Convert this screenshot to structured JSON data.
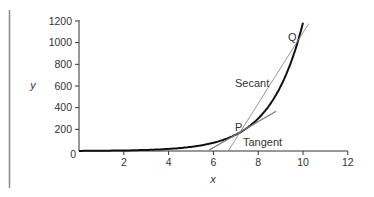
{
  "chart_data": {
    "type": "line",
    "title": "",
    "xlabel": "x",
    "ylabel": "y",
    "xlim": [
      0,
      12
    ],
    "ylim": [
      0,
      1200
    ],
    "xticks": [
      0,
      2,
      4,
      6,
      8,
      10,
      12
    ],
    "xtick_labels": [
      "0",
      "2",
      "4",
      "6",
      "8",
      "10",
      "12"
    ],
    "yticks": [
      0,
      200,
      400,
      600,
      800,
      1000,
      1200
    ],
    "ytick_labels": [
      "0",
      "200",
      "400",
      "600",
      "800",
      "1000",
      "1200"
    ],
    "grid": false,
    "legend": null,
    "series": [
      {
        "name": "curve",
        "style": "thick dark",
        "x": [
          0,
          1,
          2,
          3,
          4,
          4.5,
          5,
          5.5,
          6,
          6.5,
          7,
          7.2,
          7.5,
          8,
          8.5,
          9,
          9.5,
          9.75,
          10,
          10.05
        ],
        "y": [
          1,
          1,
          5,
          10,
          19,
          27,
          38,
          54,
          76,
          107,
          150,
          175,
          214,
          302,
          426,
          602,
          849,
          1010,
          1198,
          1220
        ]
      },
      {
        "name": "Secant",
        "style": "thin gray",
        "x": [
          6.66,
          10.25
        ],
        "y": [
          0,
          1175
        ]
      },
      {
        "name": "Tangent",
        "style": "medium gray",
        "x": [
          5.8,
          8.8
        ],
        "y": [
          7,
          367
        ]
      }
    ],
    "points": [
      {
        "label": "P",
        "x": 7.2,
        "y": 175
      },
      {
        "label": "Q",
        "x": 9.75,
        "y": 1010
      }
    ],
    "annotations": [
      {
        "text": "Secant",
        "x": 7.6,
        "y": 620
      },
      {
        "text": "Tangent",
        "x": 7.8,
        "y": 70
      },
      {
        "text": "P",
        "x": 6.9,
        "y": 215
      },
      {
        "text": "Q",
        "x": 9.35,
        "y": 1000
      }
    ]
  },
  "labels": {
    "x_axis": "x",
    "y_axis": "y",
    "secant": "Secant",
    "tangent": "Tangent",
    "point_p": "P",
    "point_q": "Q",
    "origin": "0"
  }
}
